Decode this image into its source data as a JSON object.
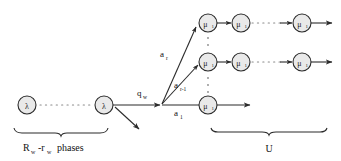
{
  "diagram": {
    "title": "",
    "type": "queueing-markov-chain-transition-diagram",
    "colors": {
      "node_fill": "#e9e9e9",
      "stroke": "#2b2b2b",
      "dots": "#8a8a8a",
      "background": "#ffffff"
    },
    "nodes": {
      "lambda": {
        "symbol": "λ",
        "subscript": ""
      },
      "mu": {
        "symbol": "μ",
        "subscript": "1"
      }
    },
    "phase_chain": {
      "first_node_label": "λ",
      "last_node_label": "λ",
      "ellipsis": "· · · ·",
      "group_label_main": "R",
      "group_label_sub1": "w",
      "group_label_minus": "-r",
      "group_label_sub2": "w",
      "group_label_tail": "phases"
    },
    "service_group": {
      "group_label": "U"
    },
    "edges": [
      {
        "name": "branch-out",
        "label": "q",
        "subscript": "w"
      },
      {
        "name": "top-branch",
        "label": "a",
        "subscript": "r"
      },
      {
        "name": "middle-branch",
        "label": "a",
        "subscript": "r-1"
      },
      {
        "name": "bottom-branch",
        "label": "a",
        "subscript": "1"
      }
    ],
    "rows": [
      {
        "name": "top-row",
        "nodes": [
          {
            "label": "μ",
            "subscript": "1"
          },
          {
            "label": "μ",
            "subscript": "1"
          },
          {
            "label": "μ",
            "subscript": "1"
          }
        ],
        "ellipsis": "· · ·"
      },
      {
        "name": "middle-row",
        "nodes": [
          {
            "label": "μ",
            "subscript": "1"
          },
          {
            "label": "μ",
            "subscript": "1"
          },
          {
            "label": "μ",
            "subscript": "1"
          }
        ],
        "ellipsis": "· · ·"
      },
      {
        "name": "bottom-row",
        "nodes": [
          {
            "label": "μ",
            "subscript": "1"
          }
        ],
        "ellipsis": ""
      }
    ],
    "vertical_ellipsis": "·"
  }
}
